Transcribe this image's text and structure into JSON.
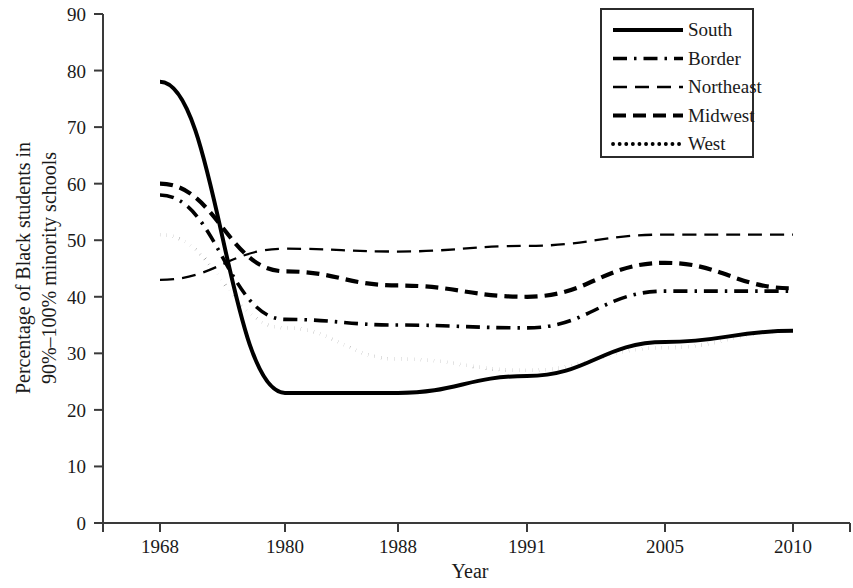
{
  "chart_data": {
    "type": "line",
    "title": "",
    "xlabel": "Year",
    "ylabel": "Percentage of Black students in 90%–100% minority schools",
    "ylabel_line1": "Percentage of Black students in",
    "ylabel_line2": "90%–100% minority schools",
    "categories": [
      "1968",
      "1980",
      "1988",
      "1991",
      "2005",
      "2010"
    ],
    "x": [
      1968,
      1980,
      1988,
      1991,
      2005,
      2010
    ],
    "ylim": [
      0,
      90
    ],
    "ytick_labels": [
      "0",
      "10",
      "20",
      "30",
      "40",
      "50",
      "60",
      "70",
      "80",
      "90"
    ],
    "yticks": [
      0,
      10,
      20,
      30,
      40,
      50,
      60,
      70,
      80,
      90
    ],
    "grid": false,
    "legend_position": "top-right",
    "series": [
      {
        "name": "South",
        "style": "solid",
        "color": "#000000",
        "values": [
          78,
          23,
          23,
          26,
          32,
          34
        ]
      },
      {
        "name": "Border",
        "style": "dash-dot",
        "color": "#000000",
        "values": [
          58,
          36,
          35,
          34.5,
          41,
          41
        ]
      },
      {
        "name": "Northeast",
        "style": "long-dash",
        "color": "#000000",
        "values": [
          43,
          48.5,
          48,
          49,
          51,
          51
        ]
      },
      {
        "name": "Midwest",
        "style": "thick-dash",
        "color": "#000000",
        "values": [
          60,
          44.5,
          42,
          40,
          46,
          41.5
        ]
      },
      {
        "name": "West",
        "style": "dotted",
        "color": "#000000",
        "values": [
          51,
          34.5,
          29,
          27,
          31,
          34
        ]
      }
    ]
  },
  "legend": {
    "entries": [
      {
        "label": "South"
      },
      {
        "label": "Border"
      },
      {
        "label": "Northeast"
      },
      {
        "label": "Midwest"
      },
      {
        "label": "West"
      }
    ]
  },
  "axes": {
    "x_title": "Year",
    "y_title_line1": "Percentage of Black students in",
    "y_title_line2": "90%–100% minority schools"
  }
}
